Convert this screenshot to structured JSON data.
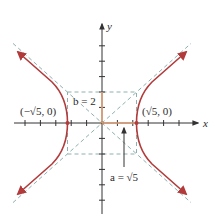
{
  "figure": {
    "equation": {
      "a_squared": 5,
      "b_squared": 4,
      "orientation": "horizontal"
    },
    "axes": {
      "x_label": "x",
      "y_label": "y",
      "x_ticks": [
        -6,
        -5,
        -4,
        -3,
        -2,
        -1,
        1,
        2,
        3,
        4,
        5,
        6
      ],
      "y_ticks": [
        -6,
        -5,
        -4,
        -3,
        -2,
        -1,
        1,
        2,
        3,
        4,
        5
      ]
    },
    "vertices": [
      {
        "label": "(−√5, 0)",
        "x": -2.236,
        "y": 0
      },
      {
        "label": "(√5, 0)",
        "x": 2.236,
        "y": 0
      }
    ],
    "annotations": {
      "b_label": "b = 2",
      "a_label": "a = √5"
    },
    "asymptotes": [
      "y = (2/√5)x",
      "y = −(2/√5)x"
    ],
    "colors": {
      "curve": "#b33a3a",
      "asymptote": "#8fb0b0",
      "axis": "#333333",
      "a_segment": "#e3a27a",
      "b_segment": "#e3a27a"
    }
  }
}
